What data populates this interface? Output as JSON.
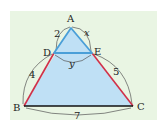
{
  "diagram": {
    "type": "similar-triangles",
    "colors": {
      "panel": "#e9f5e3",
      "fill": "#bfe0f5",
      "small_triangle_stroke": "#4a9fd8",
      "side_stroke": "#d0304a",
      "base_stroke": "#111111",
      "arc_stroke": "#555555"
    },
    "vertices": {
      "A": {
        "label": "A",
        "x": 71,
        "y": 28
      },
      "B": {
        "label": "B",
        "x": 24,
        "y": 106
      },
      "C": {
        "label": "C",
        "x": 133,
        "y": 106
      },
      "D": {
        "label": "D",
        "x": 54,
        "y": 53
      },
      "E": {
        "label": "E",
        "x": 92,
        "y": 53
      }
    },
    "segments": {
      "AD": {
        "label": "2"
      },
      "AE": {
        "label": "x"
      },
      "DE": {
        "label": "y"
      },
      "DB": {
        "label": "4"
      },
      "EC": {
        "label": "5"
      },
      "BC": {
        "label": "7"
      }
    }
  }
}
